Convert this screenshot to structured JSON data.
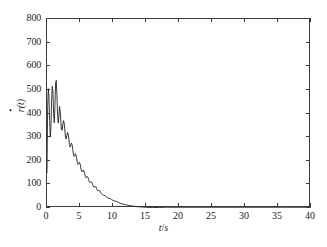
{
  "chart_data": {
    "type": "line",
    "title": "",
    "xlabel": "t/s",
    "ylabel": "ṙ(t)",
    "ylabel_base": "r",
    "ylabel_suffix": "(t)",
    "xlabel_var": "t",
    "xlabel_sep": "/",
    "xlabel_unit": "s",
    "xlim": [
      0,
      40
    ],
    "ylim": [
      0,
      800
    ],
    "grid": false,
    "legend": null,
    "line_color": "#222222",
    "line_width": 0.9,
    "xticks": [
      0,
      5,
      10,
      15,
      20,
      25,
      30,
      35,
      40
    ],
    "yticks": [
      0,
      100,
      200,
      300,
      400,
      500,
      600,
      700,
      800
    ],
    "xticklabels": [
      "0",
      "5",
      "10",
      "15",
      "20",
      "25",
      "30",
      "35",
      "40"
    ],
    "yticklabels": [
      "0",
      "100",
      "200",
      "300",
      "400",
      "500",
      "600",
      "700",
      "800"
    ],
    "series": [
      {
        "name": "r_dot",
        "x": [
          0.0,
          0.1,
          0.2,
          0.3,
          0.4,
          0.5,
          0.6,
          0.7,
          0.8,
          0.9,
          1.0,
          1.1,
          1.2,
          1.3,
          1.4,
          1.5,
          1.6,
          1.7,
          1.8,
          1.9,
          2.0,
          2.1,
          2.2,
          2.3,
          2.4,
          2.5,
          2.6,
          2.7,
          2.8,
          2.9,
          3.0,
          3.1,
          3.2,
          3.3,
          3.4,
          3.5,
          3.6,
          3.7,
          3.8,
          3.9,
          4.0,
          4.1,
          4.2,
          4.3,
          4.4,
          4.5,
          4.6,
          4.7,
          4.8,
          4.9,
          5.0,
          5.1,
          5.2,
          5.3,
          5.4,
          5.5,
          5.6,
          5.7,
          5.8,
          5.9,
          6.0,
          6.1,
          6.2,
          6.3,
          6.4,
          6.5,
          6.6,
          6.7,
          6.8,
          6.9,
          7.0,
          7.1,
          7.2,
          7.3,
          7.4,
          7.5,
          7.6,
          7.7,
          7.8,
          7.9,
          8.0,
          8.2,
          8.4,
          8.6,
          8.8,
          9.0,
          9.2,
          9.4,
          9.6,
          9.8,
          10.0,
          10.2,
          10.4,
          10.6,
          10.8,
          11.0,
          11.3,
          11.6,
          11.9,
          12.2,
          12.5,
          12.8,
          13.1,
          13.5,
          14.0,
          14.5,
          15.0,
          16.0,
          17.0,
          18.0,
          20.0,
          22.0,
          25.0,
          28.0,
          32.0,
          36.0,
          40.0
        ],
        "y": [
          150,
          430,
          505,
          470,
          370,
          300,
          345,
          455,
          515,
          490,
          400,
          360,
          430,
          525,
          540,
          480,
          395,
          360,
          390,
          430,
          410,
          365,
          330,
          330,
          355,
          370,
          360,
          330,
          300,
          292,
          305,
          320,
          315,
          295,
          270,
          258,
          265,
          275,
          268,
          248,
          228,
          218,
          222,
          230,
          224,
          208,
          192,
          184,
          188,
          194,
          188,
          174,
          160,
          153,
          156,
          161,
          156,
          145,
          134,
          128,
          130,
          134,
          130,
          121,
          112,
          107,
          109,
          112,
          108,
          100,
          93,
          89,
          90,
          93,
          90,
          83,
          77,
          73,
          74,
          76,
          73,
          62,
          57,
          54,
          52,
          47,
          43,
          41,
          40,
          36,
          32,
          30,
          29,
          27,
          24,
          21,
          18,
          16,
          14,
          12,
          10,
          9,
          8,
          6,
          5,
          4,
          3,
          2,
          2,
          1,
          1,
          1,
          1,
          1,
          1,
          1,
          1
        ]
      }
    ]
  },
  "axes": {
    "box_color": "#3a3a3a"
  }
}
